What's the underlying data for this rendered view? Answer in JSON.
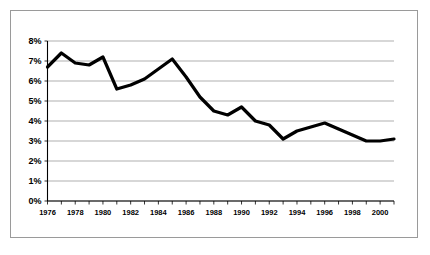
{
  "chart_data": {
    "type": "line",
    "title": "",
    "subtitle": "",
    "xlabel": "",
    "ylabel": "",
    "x": [
      1976,
      1977,
      1978,
      1979,
      1980,
      1981,
      1982,
      1983,
      1984,
      1985,
      1986,
      1987,
      1988,
      1989,
      1990,
      1991,
      1992,
      1993,
      1994,
      1995,
      1996,
      1997,
      1998,
      1999,
      2000,
      2001
    ],
    "values": [
      6.7,
      7.4,
      6.9,
      6.8,
      7.2,
      5.6,
      5.8,
      6.1,
      6.6,
      7.1,
      6.2,
      5.2,
      4.5,
      4.3,
      4.7,
      4.0,
      3.8,
      3.1,
      3.5,
      3.7,
      3.9,
      3.6,
      3.3,
      3.0,
      3.0,
      3.1
    ],
    "series": [
      {
        "name": "Rate",
        "values": [
          6.7,
          7.4,
          6.9,
          6.8,
          7.2,
          5.6,
          5.8,
          6.1,
          6.6,
          7.1,
          6.2,
          5.2,
          4.5,
          4.3,
          4.7,
          4.0,
          3.8,
          3.1,
          3.5,
          3.7,
          3.9,
          3.6,
          3.3,
          3.0,
          3.0,
          3.1
        ],
        "color": "#000000"
      }
    ],
    "ylim": [
      0,
      8
    ],
    "xlim": [
      1976,
      2001
    ],
    "ytick_labels": [
      "0%",
      "1%",
      "2%",
      "3%",
      "4%",
      "5%",
      "6%",
      "7%",
      "8%"
    ],
    "ytick_values": [
      0,
      1,
      2,
      3,
      4,
      5,
      6,
      7,
      8
    ],
    "xtick_values": [
      1976,
      1977,
      1978,
      1979,
      1980,
      1981,
      1982,
      1983,
      1984,
      1985,
      1986,
      1987,
      1988,
      1989,
      1990,
      1991,
      1992,
      1993,
      1994,
      1995,
      1996,
      1997,
      1998,
      1999,
      2000,
      2001
    ],
    "xtick_labels": [
      "1976",
      "1978",
      "1980",
      "1982",
      "1984",
      "1986",
      "1988",
      "1990",
      "1992",
      "1994",
      "1996",
      "1998",
      "2000"
    ],
    "xtick_label_values": [
      1976,
      1978,
      1980,
      1982,
      1984,
      1986,
      1988,
      1990,
      1992,
      1994,
      1996,
      1998,
      2000
    ],
    "grid": true,
    "grid_color": "#8c8c8c",
    "legend": false,
    "legend_position": "none",
    "annotations": [],
    "line_color": "#000000",
    "background_color": "#ffffff",
    "border_color": "#9a9a9a"
  }
}
